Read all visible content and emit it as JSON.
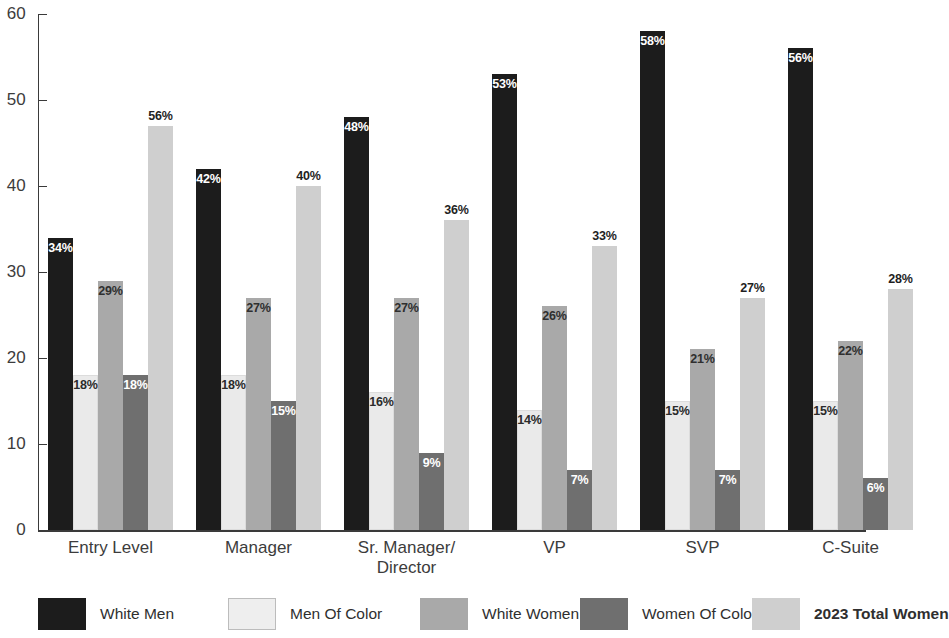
{
  "chart_data": {
    "type": "bar",
    "title": "",
    "subtitle": "",
    "xlabel": "",
    "ylabel": "",
    "ylim": [
      0,
      60
    ],
    "yticks": [
      0,
      10,
      20,
      30,
      40,
      50,
      60
    ],
    "ytick_labels": [
      "0",
      "10",
      "20",
      "30",
      "40",
      "50",
      "60"
    ],
    "grid": false,
    "legend_position": "bottom",
    "value_suffix": "%",
    "categories": [
      "Entry Level",
      "Manager",
      "Sr. Manager/\nDirector",
      "VP",
      "SVP",
      "C-Suite"
    ],
    "series": [
      {
        "name": "White Men",
        "color": "#1c1c1c",
        "values": [
          34,
          42,
          48,
          53,
          58,
          56
        ],
        "labels": [
          "34%",
          "42%",
          "48%",
          "53%",
          "58%",
          "56%"
        ]
      },
      {
        "name": "Men Of Color",
        "color": "#eaeaea",
        "values": [
          18,
          18,
          16,
          14,
          15,
          15
        ],
        "labels": [
          "18%",
          "18%",
          "16%",
          "14%",
          "15%",
          "15%"
        ]
      },
      {
        "name": "White Women",
        "color": "#a9a9a9",
        "values": [
          29,
          27,
          27,
          26,
          21,
          22
        ],
        "labels": [
          "29%",
          "27%",
          "27%",
          "26%",
          "21%",
          "22%"
        ]
      },
      {
        "name": "Women Of Color",
        "color": "#6f6f6f",
        "values": [
          18,
          15,
          9,
          7,
          7,
          6
        ],
        "labels": [
          "18%",
          "15%",
          "9%",
          "7%",
          "7%",
          "6%"
        ]
      },
      {
        "name": "2023 Total Women",
        "color": "#cfcfcf",
        "values": [
          47,
          40,
          36,
          33,
          27,
          28
        ],
        "labels": [
          "56%",
          "40%",
          "36%",
          "33%",
          "27%",
          "28%"
        ],
        "emphasis": true
      }
    ]
  },
  "legend": {
    "items": [
      {
        "label": "White Men",
        "color": "#1c1c1c",
        "bold": false,
        "border": false
      },
      {
        "label": "Men Of Color",
        "color": "#eeeeee",
        "bold": false,
        "border": true
      },
      {
        "label": "White Women",
        "color": "#a9a9a9",
        "bold": false,
        "border": false
      },
      {
        "label": "Women Of Color",
        "color": "#6f6f6f",
        "bold": false,
        "border": false
      },
      {
        "label": "2023 Total Women",
        "color": "#cfcfcf",
        "bold": true,
        "border": false
      }
    ]
  },
  "axis": {
    "axis_color": "#3a3a3a",
    "tick_label_color": "#3c3c3c"
  }
}
